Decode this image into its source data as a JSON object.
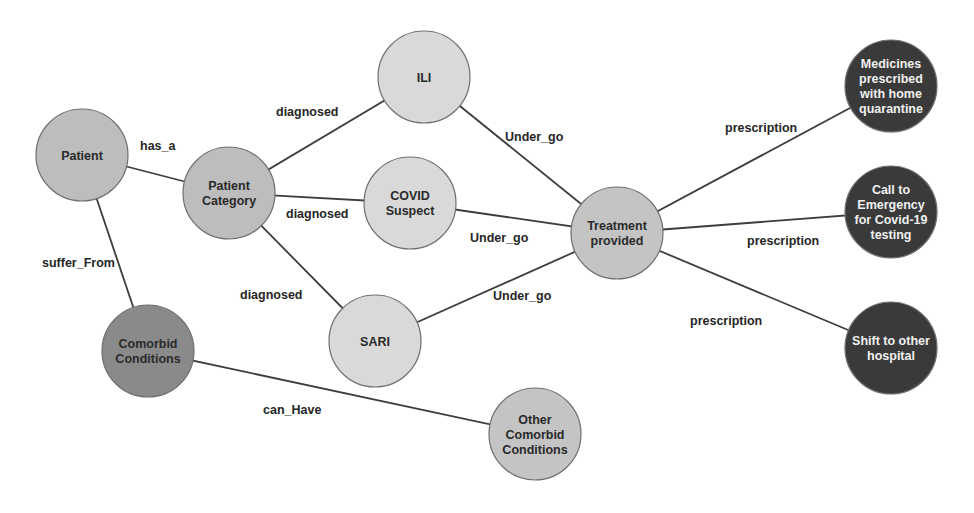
{
  "diagram": {
    "type": "knowledge-graph",
    "colors": {
      "background": "#ffffff",
      "edge": "#3d3d3d",
      "light_node": "#d9d9d9",
      "medium_node": "#bdbdbd",
      "dark_node": "#8a8a8a",
      "black_node": "#3a3a3a",
      "dark_text": "#2a2a2a",
      "light_text": "#f0f0f0"
    },
    "nodes": [
      {
        "id": "patient",
        "lines": [
          "Patient"
        ],
        "x": 82,
        "y": 155,
        "r": 46,
        "fill": "#bdbdbd",
        "text": "#2a2a2a"
      },
      {
        "id": "patient-category",
        "lines": [
          "Patient",
          "Category"
        ],
        "x": 229,
        "y": 193,
        "r": 46,
        "fill": "#bdbdbd",
        "text": "#2a2a2a"
      },
      {
        "id": "ili",
        "lines": [
          "ILI"
        ],
        "x": 424,
        "y": 77,
        "r": 46,
        "fill": "#d9d9d9",
        "text": "#2a2a2a"
      },
      {
        "id": "covid-suspect",
        "lines": [
          "COVID",
          "Suspect"
        ],
        "x": 410,
        "y": 203,
        "r": 46,
        "fill": "#d9d9d9",
        "text": "#2a2a2a"
      },
      {
        "id": "sari",
        "lines": [
          "SARI"
        ],
        "x": 375,
        "y": 341,
        "r": 46,
        "fill": "#d9d9d9",
        "text": "#2a2a2a"
      },
      {
        "id": "treatment-provided",
        "lines": [
          "Treatment",
          "provided"
        ],
        "x": 617,
        "y": 233,
        "r": 46,
        "fill": "#c4c4c4",
        "text": "#2a2a2a"
      },
      {
        "id": "comorbid-conditions",
        "lines": [
          "Comorbid",
          "Conditions"
        ],
        "x": 148,
        "y": 351,
        "r": 46,
        "fill": "#8a8a8a",
        "text": "#2a2a2a"
      },
      {
        "id": "other-comorbid-conditions",
        "lines": [
          "Other",
          "Comorbid",
          "Conditions"
        ],
        "x": 535,
        "y": 434,
        "r": 46,
        "fill": "#c4c4c4",
        "text": "#2a2a2a"
      },
      {
        "id": "medicines-home-quarantine",
        "lines": [
          "Medicines",
          "prescribed",
          "with home",
          "quarantine"
        ],
        "x": 891,
        "y": 86,
        "r": 46,
        "fill": "#3a3a3a",
        "text": "#f0f0f0"
      },
      {
        "id": "call-to-emergency",
        "lines": [
          "Call to",
          "Emergency",
          "for Covid-19",
          "testing"
        ],
        "x": 891,
        "y": 212,
        "r": 46,
        "fill": "#3a3a3a",
        "text": "#f0f0f0"
      },
      {
        "id": "shift-to-other-hospital",
        "lines": [
          "Shift to other",
          "hospital"
        ],
        "x": 891,
        "y": 348,
        "r": 46,
        "fill": "#3a3a3a",
        "text": "#f0f0f0"
      }
    ],
    "edges": [
      {
        "from": "patient",
        "to": "patient-category",
        "label": "has_a",
        "lx": 140,
        "ly": 150
      },
      {
        "from": "patient",
        "to": "comorbid-conditions",
        "label": "suffer_From",
        "lx": 42,
        "ly": 267
      },
      {
        "from": "patient-category",
        "to": "ili",
        "label": "diagnosed",
        "lx": 276,
        "ly": 116
      },
      {
        "from": "patient-category",
        "to": "covid-suspect",
        "label": "diagnosed",
        "lx": 286,
        "ly": 218
      },
      {
        "from": "patient-category",
        "to": "sari",
        "label": "diagnosed",
        "lx": 240,
        "ly": 299
      },
      {
        "from": "ili",
        "to": "treatment-provided",
        "label": "Under_go",
        "lx": 505,
        "ly": 141
      },
      {
        "from": "covid-suspect",
        "to": "treatment-provided",
        "label": "Under_go",
        "lx": 470,
        "ly": 242
      },
      {
        "from": "sari",
        "to": "treatment-provided",
        "label": "Under_go",
        "lx": 493,
        "ly": 300
      },
      {
        "from": "treatment-provided",
        "to": "medicines-home-quarantine",
        "label": "prescription",
        "lx": 725,
        "ly": 132
      },
      {
        "from": "treatment-provided",
        "to": "call-to-emergency",
        "label": "prescription",
        "lx": 747,
        "ly": 245
      },
      {
        "from": "treatment-provided",
        "to": "shift-to-other-hospital",
        "label": "prescription",
        "lx": 690,
        "ly": 325
      },
      {
        "from": "comorbid-conditions",
        "to": "other-comorbid-conditions",
        "label": "can_Have",
        "lx": 263,
        "ly": 414
      }
    ]
  }
}
